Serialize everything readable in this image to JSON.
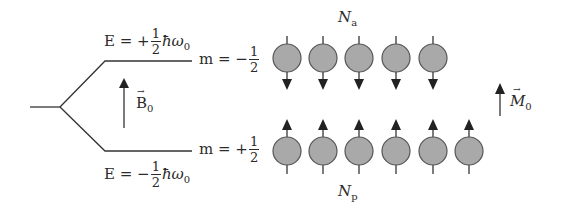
{
  "diagram": {
    "upper_level": {
      "energy_prefix": "E = +",
      "fraction_num": "1",
      "fraction_den": "2",
      "energy_suffix": "ħω",
      "energy_sub": "0",
      "m_prefix": "m = −",
      "m_num": "1",
      "m_den": "2",
      "population_symbol": "N",
      "population_sub": "a",
      "spin_count": 5,
      "spin_direction": "down"
    },
    "lower_level": {
      "energy_prefix": "E = −",
      "fraction_num": "1",
      "fraction_den": "2",
      "energy_suffix": "ħω",
      "energy_sub": "0",
      "m_prefix": "m = +",
      "m_num": "1",
      "m_den": "2",
      "population_symbol": "N",
      "population_sub": "p",
      "spin_count": 6,
      "spin_direction": "up"
    },
    "field": {
      "symbol": "B",
      "sub": "0",
      "vector_mark": "→"
    },
    "magnetization": {
      "symbol": "M",
      "sub": "0",
      "vector_mark": "→"
    },
    "colors": {
      "line": "#333333",
      "spin_fill": "#a9a9a9",
      "spin_stroke": "#555555",
      "text": "#2b2b2b"
    }
  }
}
